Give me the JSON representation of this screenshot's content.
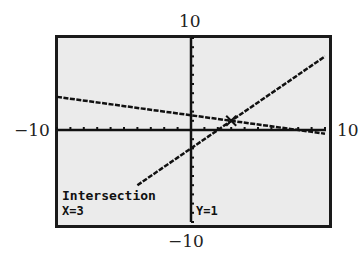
{
  "chart_data": {
    "type": "line",
    "title": "",
    "xlabel": "",
    "ylabel": "",
    "xlim": [
      -10,
      10
    ],
    "ylim": [
      -10,
      10
    ],
    "grid": false,
    "axis_labels": {
      "xmin": "−10",
      "xmax": "10",
      "ymin": "−10",
      "ymax": "10"
    },
    "series": [
      {
        "name": "line1",
        "equation_estimate": "y = -x/5 + 8/5",
        "x": [
          -10,
          0,
          3,
          10
        ],
        "y": [
          3.6,
          1.6,
          1,
          -0.4
        ]
      },
      {
        "name": "line2",
        "equation_estimate": "y = x - 2",
        "x": [
          -4,
          0,
          3,
          10
        ],
        "y": [
          -6,
          -2,
          1,
          8
        ]
      }
    ],
    "annotations": [
      {
        "text": "Intersection",
        "type": "label"
      },
      {
        "text": "X=3",
        "type": "value"
      },
      {
        "text": "Y=1",
        "type": "value"
      }
    ],
    "intersection": {
      "x": 3,
      "y": 1
    }
  },
  "labels": {
    "ymax": "10",
    "ymin": "−10",
    "xmin": "−10",
    "xmax": "10"
  },
  "screen": {
    "title": "Intersection",
    "x_value": "X=3",
    "y_value": "Y=1"
  }
}
